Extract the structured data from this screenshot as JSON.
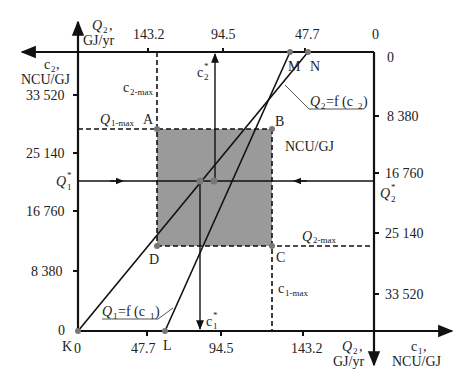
{
  "colors": {
    "axis": "#111111",
    "region_fill": "#9a9a9a",
    "point": "#777777",
    "text": "#222222"
  },
  "axes": {
    "top_q2": {
      "label_line1": "Q",
      "label_sub": "2",
      "label_line2": "GJ/yr",
      "ticks": [
        "143.2",
        "94.5",
        "47.7",
        "0"
      ]
    },
    "left_c2": {
      "label_line1": "c",
      "label_sub": "2",
      "label_line2": "NCU/GJ",
      "ticks": [
        "33 520",
        "25 140",
        "16 760",
        "8 380",
        "0"
      ]
    },
    "right_c2_scale": {
      "unit": "NCU/GJ",
      "ticks": [
        "0",
        "8 380",
        "16 760",
        "25 140",
        "33 520"
      ]
    },
    "bottom_q2": {
      "ticks": [
        "0",
        "47.7",
        "94.5",
        "143.2"
      ],
      "label_line1": "Q",
      "label_sub": "2",
      "label_line2": "GJ/yr"
    },
    "c1_axis": {
      "label_line1": "c",
      "label_sub": "1",
      "label_line2": "NCU/GJ"
    }
  },
  "points": {
    "A": "A",
    "B": "B",
    "C": "C",
    "D": "D",
    "K": "K",
    "L": "L",
    "M": "M",
    "N": "N"
  },
  "labels": {
    "c2_max": {
      "main": "c",
      "sub": "2-max"
    },
    "c1_max": {
      "main": "c",
      "sub": "1-max"
    },
    "q1_max": {
      "main": "Q",
      "sub": "1-max"
    },
    "q2_max": {
      "main": "Q",
      "sub": "2-max"
    },
    "q1_star": {
      "main": "Q",
      "sub": "1",
      "sup": "*"
    },
    "q2_star": {
      "main": "Q",
      "sub": "2",
      "sup": "*"
    },
    "c1_star": {
      "main": "c",
      "sub": "1",
      "sup": "*"
    },
    "c2_star": {
      "main": "c",
      "sub": "2",
      "sup": "*"
    },
    "func_q1": {
      "main": "Q",
      "sub": "1",
      "rest": "=f (c",
      "sub2": "1",
      "close": ")"
    },
    "func_q2": {
      "main": "Q",
      "sub": "2",
      "rest": "=f (c",
      "sub2": "2",
      "close": ")"
    }
  }
}
